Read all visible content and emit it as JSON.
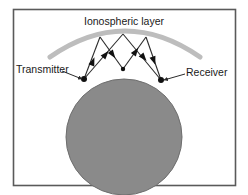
{
  "figure": {
    "kind": "ionospheric-skywave-propagation-diagram",
    "background_color": "#ffffff",
    "frame": {
      "border_color": "#5a5a5a",
      "fill": "#ffffff",
      "x": 13,
      "y": 9,
      "width": 222,
      "height": 176
    }
  },
  "labels": {
    "ionosphere": "Ionospheric layer",
    "transmitter": "Transmitter",
    "receiver": "Receiver"
  },
  "colors": {
    "earth_fill": "#8a8a8a",
    "earth_stroke": "#6e6e6e",
    "ionosphere_arc": "#bdbdbd",
    "ray_stroke": "#2b2b2b",
    "node_fill": "#111111",
    "text": "#1a1a1a",
    "leader_stroke": "#2b2b2b"
  },
  "earth": {
    "center_x": 124,
    "center_y": 137,
    "radius": 58
  },
  "ionosphere": {
    "arc_start_x": 50,
    "arc_start_y": 57,
    "arc_end_x": 200,
    "arc_end_y": 57,
    "arc_peak_y": 31,
    "stroke_width": 5
  },
  "nodes": {
    "transmitter": {
      "x": 84,
      "y": 79
    },
    "receiver": {
      "x": 161,
      "y": 80
    },
    "ground_bounce": {
      "x": 123,
      "y": 69
    },
    "apex_left": {
      "x": 100,
      "y": 37
    },
    "apex_mid": {
      "x": 123,
      "y": 34
    },
    "apex_right": {
      "x": 146,
      "y": 37
    }
  },
  "ray_paths": [
    {
      "name": "path-a-outbound-hop-1",
      "points": [
        [
          84,
          79
        ],
        [
          100,
          37
        ]
      ],
      "arrow_at": [
        93,
        61
      ]
    },
    {
      "name": "path-a-inbound-hop-1",
      "points": [
        [
          100,
          37
        ],
        [
          123,
          69
        ]
      ],
      "arrow_at": [
        113,
        55
      ]
    },
    {
      "name": "path-a-outbound-hop-2",
      "points": [
        [
          123,
          69
        ],
        [
          146,
          37
        ]
      ],
      "arrow_at": [
        136,
        51
      ]
    },
    {
      "name": "path-a-inbound-hop-2",
      "points": [
        [
          146,
          37
        ],
        [
          161,
          80
        ]
      ],
      "arrow_at": [
        154,
        61
      ]
    },
    {
      "name": "path-b-outbound-hop-1",
      "points": [
        [
          84,
          79
        ],
        [
          123,
          34
        ]
      ],
      "arrow_at": [
        106,
        54
      ]
    },
    {
      "name": "path-b-inbound-hop-1",
      "points": [
        [
          123,
          34
        ],
        [
          161,
          80
        ]
      ],
      "arrow_at": [
        144,
        58
      ]
    }
  ],
  "leaders": [
    {
      "name": "transmitter-leader",
      "from": [
        62,
        71
      ],
      "to": [
        82,
        79
      ]
    },
    {
      "name": "receiver-leader",
      "from": [
        185,
        74
      ],
      "to": [
        164,
        80
      ]
    }
  ],
  "text_positions": {
    "ionosphere": {
      "x": 124,
      "y": 25,
      "font_size": 10.5,
      "anchor": "middle"
    },
    "transmitter": {
      "x": 16,
      "y": 73,
      "font_size": 10.5,
      "anchor": "start"
    },
    "receiver": {
      "x": 186,
      "y": 76,
      "font_size": 10.5,
      "anchor": "start"
    }
  }
}
